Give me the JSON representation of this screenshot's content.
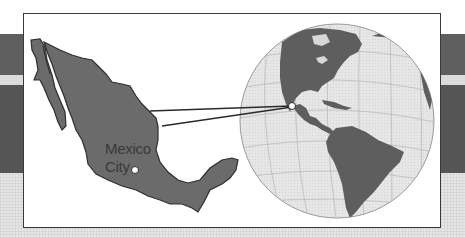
{
  "figure": {
    "map_label_line1": "Mexico",
    "map_label_line2": "City",
    "colors": {
      "land": "#6b6b6b",
      "land_outline": "#2e2e2e",
      "globe_ocean": "#e4e4e4",
      "band_dark": "#5a5a5a",
      "band_light": "#dcdcdc",
      "frame_border": "#3a3a3a",
      "connector_lines": "#2a2a2a",
      "marker": "#ffffff"
    },
    "elements": {
      "left_map": "Mexico",
      "marker": "Mexico City",
      "right_globe": "Western Hemisphere (North, Central and South America)"
    }
  }
}
